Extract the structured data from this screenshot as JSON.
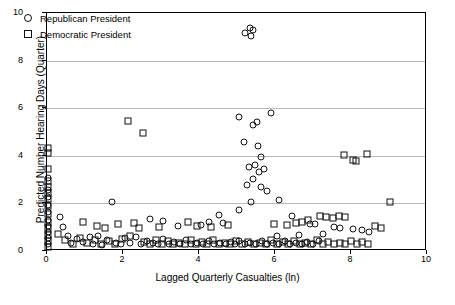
{
  "chart_data": {
    "type": "scatter",
    "title": "",
    "xlabel": "Lagged Quarterly Casualties (ln)",
    "ylabel": "Predicted Number Hearing Days (Quarter)",
    "xlim": [
      0,
      10
    ],
    "ylim": [
      0,
      10
    ],
    "xticks": [
      "0",
      "2",
      "4",
      "6",
      "8",
      "10"
    ],
    "yticks": [
      "0",
      "2",
      "4",
      "6",
      "8",
      "10"
    ],
    "grid": "horizontal",
    "legend_position": "top-left",
    "series": [
      {
        "name": "Republican President",
        "marker": "circle",
        "points": [
          [
            0.02,
            3.05
          ],
          [
            0.02,
            2.55
          ],
          [
            0.02,
            2.28
          ],
          [
            0.02,
            1.95
          ],
          [
            0.02,
            1.62
          ],
          [
            0.02,
            1.3
          ],
          [
            0.02,
            1.05
          ],
          [
            0.02,
            0.8
          ],
          [
            0.02,
            0.55
          ],
          [
            0.02,
            0.3
          ],
          [
            0.35,
            1.42
          ],
          [
            0.42,
            1.02
          ],
          [
            0.55,
            0.62
          ],
          [
            0.62,
            0.35
          ],
          [
            0.78,
            0.52
          ],
          [
            0.95,
            0.38
          ],
          [
            1.12,
            0.58
          ],
          [
            1.2,
            0.3
          ],
          [
            1.35,
            0.62
          ],
          [
            1.45,
            0.25
          ],
          [
            1.58,
            0.45
          ],
          [
            1.7,
            2.05
          ],
          [
            1.82,
            0.35
          ],
          [
            1.95,
            0.28
          ],
          [
            2.05,
            0.55
          ],
          [
            2.18,
            0.32
          ],
          [
            2.35,
            0.6
          ],
          [
            2.48,
            0.28
          ],
          [
            2.62,
            0.42
          ],
          [
            2.78,
            0.35
          ],
          [
            2.92,
            0.3
          ],
          [
            3.05,
            0.52
          ],
          [
            3.2,
            0.3
          ],
          [
            3.35,
            0.38
          ],
          [
            3.5,
            0.28
          ],
          [
            3.65,
            0.45
          ],
          [
            3.8,
            0.3
          ],
          [
            3.95,
            0.35
          ],
          [
            4.1,
            0.3
          ],
          [
            4.25,
            0.42
          ],
          [
            4.4,
            0.3
          ],
          [
            4.55,
            0.35
          ],
          [
            4.7,
            0.28
          ],
          [
            4.85,
            0.38
          ],
          [
            4.95,
            0.3
          ],
          [
            5.05,
            0.42
          ],
          [
            5.2,
            0.3
          ],
          [
            5.35,
            0.35
          ],
          [
            5.5,
            0.3
          ],
          [
            5.65,
            0.4
          ],
          [
            5.8,
            0.28
          ],
          [
            5.95,
            0.35
          ],
          [
            6.1,
            0.3
          ],
          [
            6.25,
            0.42
          ],
          [
            6.4,
            0.3
          ],
          [
            6.55,
            0.35
          ],
          [
            6.7,
            0.28
          ],
          [
            6.85,
            0.38
          ],
          [
            7.0,
            0.3
          ],
          [
            7.15,
            0.42
          ],
          [
            5.22,
            9.18
          ],
          [
            5.35,
            9.35
          ],
          [
            5.38,
            9.05
          ],
          [
            5.42,
            9.28
          ],
          [
            5.05,
            5.62
          ],
          [
            5.52,
            5.4
          ],
          [
            5.9,
            5.78
          ],
          [
            5.42,
            5.28
          ],
          [
            5.18,
            4.58
          ],
          [
            5.55,
            4.42
          ],
          [
            5.62,
            3.95
          ],
          [
            5.48,
            3.62
          ],
          [
            5.32,
            3.55
          ],
          [
            5.7,
            3.45
          ],
          [
            5.58,
            3.3
          ],
          [
            5.42,
            3.02
          ],
          [
            5.25,
            2.78
          ],
          [
            5.62,
            2.7
          ],
          [
            5.78,
            2.52
          ],
          [
            6.1,
            2.15
          ],
          [
            5.38,
            2.05
          ],
          [
            5.05,
            1.72
          ],
          [
            4.52,
            1.52
          ],
          [
            6.45,
            1.45
          ],
          [
            2.72,
            1.35
          ],
          [
            3.05,
            1.28
          ],
          [
            4.25,
            1.22
          ],
          [
            4.62,
            1.18
          ],
          [
            6.92,
            1.15
          ],
          [
            7.05,
            1.12
          ],
          [
            7.55,
            1.02
          ],
          [
            7.72,
            0.95
          ],
          [
            8.05,
            0.92
          ],
          [
            8.3,
            0.88
          ],
          [
            8.48,
            0.78
          ],
          [
            7.25,
            0.72
          ],
          [
            6.62,
            0.68
          ],
          [
            6.05,
            0.62
          ],
          [
            4.05,
            1.08
          ],
          [
            3.45,
            1.05
          ]
        ]
      },
      {
        "name": "Democratic President",
        "marker": "square",
        "points": [
          [
            0.02,
            4.32
          ],
          [
            0.02,
            4.12
          ],
          [
            0.02,
            3.45
          ],
          [
            0.02,
            2.95
          ],
          [
            0.02,
            2.7
          ],
          [
            0.02,
            2.45
          ],
          [
            0.02,
            2.18
          ],
          [
            0.02,
            1.88
          ],
          [
            0.02,
            1.55
          ],
          [
            0.02,
            1.2
          ],
          [
            0.02,
            0.95
          ],
          [
            0.02,
            0.68
          ],
          [
            0.02,
            0.42
          ],
          [
            0.02,
            0.18
          ],
          [
            0.3,
            0.72
          ],
          [
            0.48,
            0.48
          ],
          [
            0.68,
            0.3
          ],
          [
            0.88,
            0.55
          ],
          [
            1.05,
            0.32
          ],
          [
            1.25,
            0.48
          ],
          [
            1.42,
            0.28
          ],
          [
            1.62,
            0.42
          ],
          [
            1.78,
            0.3
          ],
          [
            1.98,
            0.52
          ],
          [
            2.12,
            5.45
          ],
          [
            2.52,
            4.95
          ],
          [
            2.28,
            1.18
          ],
          [
            2.42,
            0.95
          ],
          [
            2.55,
            0.38
          ],
          [
            2.72,
            0.3
          ],
          [
            2.88,
            0.48
          ],
          [
            3.02,
            0.3
          ],
          [
            3.18,
            0.42
          ],
          [
            3.32,
            0.28
          ],
          [
            3.48,
            0.35
          ],
          [
            3.62,
            0.3
          ],
          [
            3.78,
            0.48
          ],
          [
            3.92,
            0.3
          ],
          [
            4.08,
            0.38
          ],
          [
            4.22,
            0.28
          ],
          [
            4.38,
            0.45
          ],
          [
            4.52,
            0.3
          ],
          [
            4.68,
            0.35
          ],
          [
            4.82,
            0.3
          ],
          [
            4.98,
            0.42
          ],
          [
            5.12,
            0.3
          ],
          [
            5.28,
            0.38
          ],
          [
            5.45,
            0.28
          ],
          [
            5.6,
            0.35
          ],
          [
            5.75,
            0.3
          ],
          [
            5.9,
            0.45
          ],
          [
            6.05,
            0.3
          ],
          [
            6.2,
            0.38
          ],
          [
            6.35,
            0.28
          ],
          [
            6.5,
            0.42
          ],
          [
            6.65,
            0.3
          ],
          [
            6.8,
            0.35
          ],
          [
            6.95,
            0.3
          ],
          [
            7.1,
            0.45
          ],
          [
            7.25,
            0.3
          ],
          [
            7.4,
            0.38
          ],
          [
            7.55,
            0.28
          ],
          [
            7.7,
            0.35
          ],
          [
            7.85,
            0.3
          ],
          [
            8.0,
            0.42
          ],
          [
            8.15,
            0.3
          ],
          [
            8.3,
            0.38
          ],
          [
            8.45,
            0.28
          ],
          [
            7.82,
            4.02
          ],
          [
            8.12,
            3.78
          ],
          [
            8.42,
            4.08
          ],
          [
            8.05,
            3.82
          ],
          [
            9.02,
            2.05
          ],
          [
            7.18,
            1.48
          ],
          [
            7.35,
            1.42
          ],
          [
            7.52,
            1.38
          ],
          [
            7.68,
            1.45
          ],
          [
            7.85,
            1.42
          ],
          [
            6.88,
            1.32
          ],
          [
            6.72,
            1.22
          ],
          [
            6.55,
            1.18
          ],
          [
            3.72,
            1.22
          ],
          [
            3.95,
            1.05
          ],
          [
            4.32,
            1.0
          ],
          [
            4.75,
            1.08
          ],
          [
            2.95,
            1.02
          ],
          [
            1.52,
            0.98
          ],
          [
            1.88,
            1.12
          ],
          [
            8.62,
            1.05
          ],
          [
            8.78,
            0.95
          ],
          [
            5.98,
            1.15
          ],
          [
            6.32,
            1.1
          ],
          [
            2.18,
            0.62
          ],
          [
            1.32,
            1.05
          ],
          [
            0.95,
            1.22
          ]
        ]
      }
    ]
  }
}
